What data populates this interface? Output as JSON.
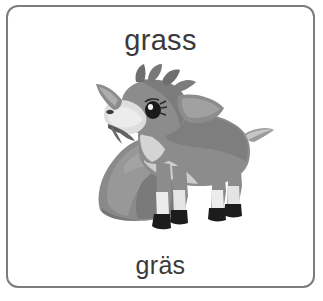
{
  "card": {
    "name": "vocabulary-flashcard",
    "border_color": "#7c7c7c",
    "background_color": "#ffffff"
  },
  "word_top": {
    "text": "grass",
    "language": "English",
    "color": "#3a3a3a"
  },
  "word_bottom": {
    "text": "gräs",
    "language": "Swedish",
    "color": "#3a3a3a"
  },
  "illustration": {
    "name": "goat-grazing-illustration",
    "subject": "young goat standing beside a rock with a sprig of grass in its mouth",
    "style": "grayscale clip-art",
    "colors": {
      "body": "#8c8c8c",
      "body_shadow": "#6f6f6f",
      "body_dark": "#5e5e5e",
      "belly_light": "#e8e8e8",
      "muzzle_light": "#dcdcdc",
      "hoof_dark": "#1c1c1c",
      "eye_dark": "#1a1a1a",
      "rock": "#8a8a8a",
      "rock_shadow": "#6e6e6e",
      "rock_light": "#a2a2a2",
      "grass_sprig": "#5a5a5a"
    }
  }
}
